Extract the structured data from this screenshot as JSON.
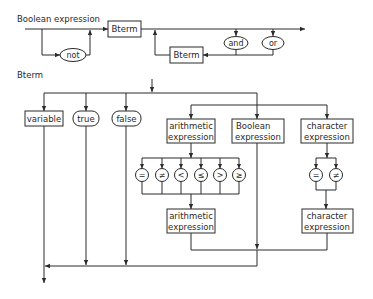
{
  "diagrams": [
    {
      "title": "Boolean expression",
      "nodes": {
        "not": "not",
        "bterm_main": "Bterm",
        "bterm_loop": "Bterm",
        "and": "and",
        "or": "or"
      }
    },
    {
      "title": "Bterm",
      "nodes": {
        "variable": "variable",
        "true": "true",
        "false": "false",
        "arith_line1": "arithmetic",
        "arith_line2": "expression",
        "bool_line1": "Boolean",
        "bool_line2": "expression",
        "char_line1": "character",
        "char_line2": "expression",
        "arith2_line1": "arithmetic",
        "arith2_line2": "expression",
        "char2_line1": "character",
        "char2_line2": "expression"
      },
      "arith_operators": [
        "=",
        "≠",
        "<",
        "≤",
        ">",
        "≥"
      ],
      "char_operators": [
        "=",
        "≠"
      ]
    }
  ],
  "colors": {
    "ink": "#2a2a2a",
    "background": "#ffffff"
  }
}
